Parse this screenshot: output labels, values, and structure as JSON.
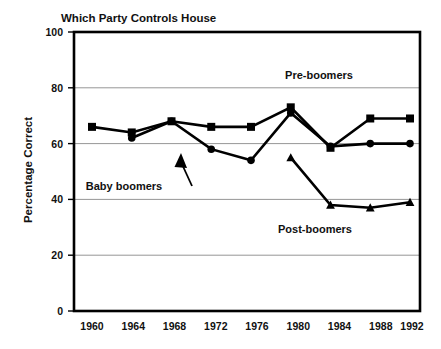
{
  "chart_data": {
    "type": "line",
    "title": "Which Party Controls House",
    "xlabel": "",
    "ylabel": "Percentage Correct",
    "x": [
      1960,
      1964,
      1968,
      1972,
      1976,
      1980,
      1984,
      1988,
      1992
    ],
    "categories": [
      "1960",
      "1964",
      "1968",
      "1972",
      "1976",
      "1980",
      "1984",
      "1988",
      "1992"
    ],
    "ylim": [
      0,
      100
    ],
    "yticks": [
      0,
      20,
      40,
      60,
      80,
      100
    ],
    "yticklabels": [
      "0",
      "20",
      "40",
      "60",
      "80",
      "100"
    ],
    "grid": "horizontal",
    "legend_position": "inline-annotations",
    "series": [
      {
        "name": "Pre-boomers",
        "marker": "square",
        "x": [
          1960,
          1964,
          1968,
          1972,
          1976,
          1980,
          1984,
          1988,
          1992
        ],
        "values": [
          66,
          64,
          68,
          66,
          66,
          73,
          58.5,
          69,
          69
        ]
      },
      {
        "name": "Baby boomers",
        "marker": "circle",
        "x": [
          1964,
          1968,
          1972,
          1976,
          1980,
          1984,
          1988,
          1992
        ],
        "values": [
          62,
          68,
          58,
          54,
          71,
          59,
          60,
          60
        ]
      },
      {
        "name": "Post-boomers",
        "marker": "triangle",
        "x": [
          1980,
          1984,
          1988,
          1992
        ],
        "values": [
          55,
          38,
          37,
          39
        ]
      }
    ],
    "annotations": [
      {
        "text": "Pre-boomers",
        "x": 1986,
        "y": 78
      },
      {
        "text": "Baby boomers",
        "x": 1965,
        "y": 46,
        "has_arrow": true
      },
      {
        "text": "Post-boomers",
        "x": 1983,
        "y": 31
      }
    ]
  }
}
